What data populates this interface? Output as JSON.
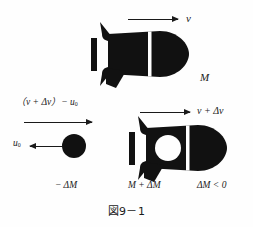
{
  "figure": {
    "caption": "図9－1",
    "background_color": "#fefefe",
    "ink_color": "#111111"
  },
  "top_panel": {
    "velocity_label": "v",
    "mass_label": "M",
    "arrow_name": "velocity-arrow-v"
  },
  "bottom_panel": {
    "exhaust_relative_velocity_label": "（v + Δv）− u",
    "exhaust_relative_velocity_subscript": "0",
    "exhaust_velocity_label": "u",
    "exhaust_velocity_subscript": "0",
    "rocket_velocity_label": "v + Δv",
    "ejected_mass_label": "− ΔM",
    "rocket_mass_label": "M + ΔM",
    "mass_condition_label": "ΔM < 0"
  }
}
